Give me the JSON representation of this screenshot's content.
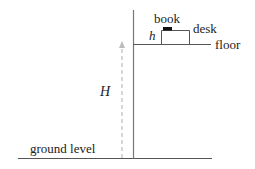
{
  "diagram": {
    "title": "",
    "labels": {
      "book": "book",
      "desk": "desk",
      "floor": "floor",
      "h": "h",
      "H": "H",
      "ground_level": "ground level"
    },
    "colors": {
      "line": "#555555",
      "dashed_arrow": "#bbbbbb",
      "book": "#111111",
      "text": "#222222"
    },
    "elements": [
      {
        "type": "vertical-wall",
        "desc": "vertical line from top to ground"
      },
      {
        "type": "floor-line",
        "desc": "horizontal upper floor line"
      },
      {
        "type": "desk",
        "desc": "rectangle on floor of height h"
      },
      {
        "type": "book",
        "desc": "small filled rectangle on desk"
      },
      {
        "type": "height-arrow",
        "desc": "dashed upward arrow labeled H from ground to floor"
      },
      {
        "type": "ground-line",
        "desc": "horizontal ground level line"
      }
    ]
  }
}
